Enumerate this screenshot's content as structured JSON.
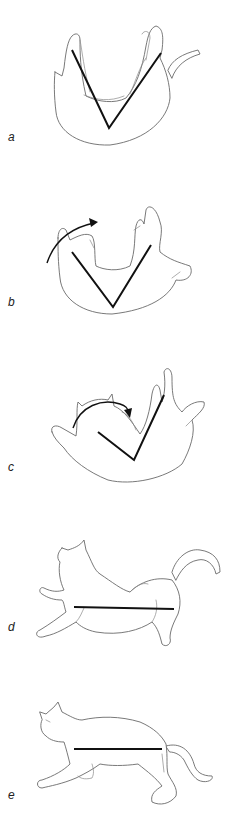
{
  "figure": {
    "panels": [
      {
        "label": "a",
        "pose": "inverted, back down",
        "axis_shape": "V"
      },
      {
        "label": "b",
        "pose": "front half begins rotating",
        "axis_shape": "V",
        "arrow": "rotation arrow over front"
      },
      {
        "label": "c",
        "pose": "front half rotated, rear follows",
        "axis_shape": "V skewed",
        "arrow": "rotation arrow over head"
      },
      {
        "label": "d",
        "pose": "upright, stretched for landing",
        "axis_shape": "straight line"
      },
      {
        "label": "e",
        "pose": "upright, landing stance",
        "axis_shape": "straight line"
      }
    ]
  },
  "colors": {
    "background": "#ffffff",
    "sketch_line": "#6a6a6a",
    "axis_line": "#111111"
  }
}
